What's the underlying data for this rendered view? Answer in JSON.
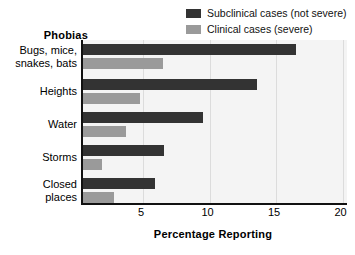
{
  "chart_data": {
    "type": "bar",
    "orientation": "horizontal",
    "title": "",
    "xlabel": "Percentage Reporting",
    "ylabel": "Phobias",
    "categories": [
      "Bugs, mice,\nsnakes, bats",
      "Heights",
      "Water",
      "Storms",
      "Closed\nplaces"
    ],
    "series": [
      {
        "name": "Subclinical cases (not severe)",
        "color": "#333333",
        "values": [
          16.5,
          13.6,
          9.5,
          6.6,
          5.9
        ]
      },
      {
        "name": "Clinical cases (severe)",
        "color": "#9a9a9a",
        "values": [
          6.5,
          4.8,
          3.7,
          1.9,
          2.8
        ]
      }
    ],
    "xlim": [
      0,
      20
    ],
    "xticks": [
      5,
      10,
      15,
      20
    ],
    "xtick_labels": [
      "5",
      "10",
      "15",
      "20"
    ],
    "grid": true,
    "grid_axis": "x",
    "legend_position": "top-right",
    "plot_background": "#f4f4f4"
  },
  "legend": {
    "items": [
      {
        "label": "Subclinical cases (not severe)",
        "color": "#333333"
      },
      {
        "label": "Clinical cases (severe)",
        "color": "#9a9a9a"
      }
    ]
  },
  "axes": {
    "y_title": "Phobias",
    "x_title": "Percentage Reporting",
    "categories": [
      {
        "line1": "Bugs, mice,",
        "line2": "snakes, bats"
      },
      {
        "line1": "Heights",
        "line2": ""
      },
      {
        "line1": "Water",
        "line2": ""
      },
      {
        "line1": "Storms",
        "line2": ""
      },
      {
        "line1": "Closed",
        "line2": "places"
      }
    ],
    "xticks": [
      "5",
      "10",
      "15",
      "20"
    ]
  }
}
